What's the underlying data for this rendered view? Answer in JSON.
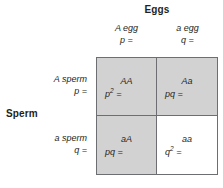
{
  "diagram": {
    "type": "punnett-square",
    "top_axis_title": "Eggs",
    "left_axis_title": "Sperm",
    "columns": [
      {
        "allele": "A egg",
        "frequency": "p ="
      },
      {
        "allele": "a egg",
        "frequency": "q ="
      }
    ],
    "rows": [
      {
        "allele": "A sperm",
        "frequency": "p ="
      },
      {
        "allele": "a sperm",
        "frequency": "q ="
      }
    ],
    "cells": [
      {
        "genotype": "AA",
        "frequency_base": "p",
        "frequency_exp": "2",
        "frequency_tail": " =",
        "shaded": true
      },
      {
        "genotype": "Aa",
        "frequency_base": "pq",
        "frequency_exp": "",
        "frequency_tail": " =",
        "shaded": true
      },
      {
        "genotype": "aA",
        "frequency_base": "pq",
        "frequency_exp": "",
        "frequency_tail": " =",
        "shaded": true
      },
      {
        "genotype": "aa",
        "frequency_base": "q",
        "frequency_exp": "2",
        "frequency_tail": " =",
        "shaded": false
      }
    ],
    "colors": {
      "shaded_fill": "#d2d2d2",
      "plain_fill": "#ffffff",
      "border": "#6d6e71",
      "text": "#231f20"
    }
  }
}
